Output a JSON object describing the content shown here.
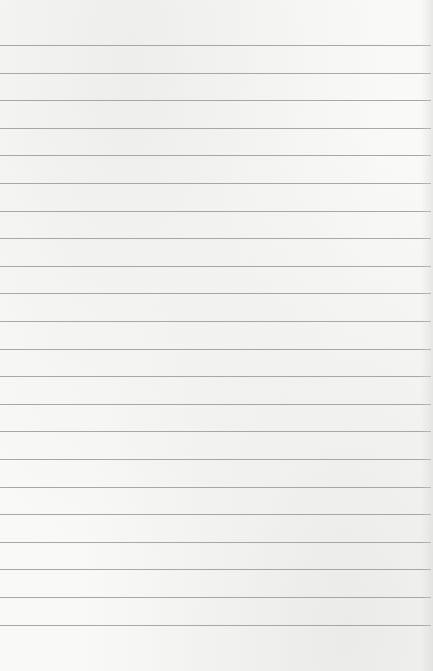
{
  "paper": {
    "kind": "lined-paper",
    "background_color": "#f9f9f8",
    "line_color": "#9a9a99",
    "line_count": 22,
    "first_line_y": 45,
    "line_spacing": 27.6
  }
}
